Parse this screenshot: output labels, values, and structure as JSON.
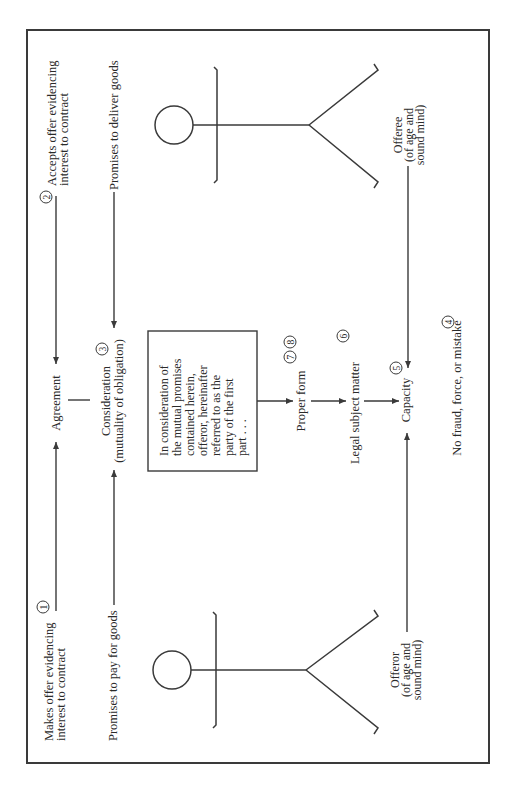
{
  "diagram": {
    "orientation": "rotated-90-ccw",
    "colors": {
      "ink": "#2a2a2a",
      "line": "#3a3a3a",
      "background": "#ffffff"
    },
    "offeror_side": {
      "step_number": "1",
      "offer_line1": "Makes offer evidencing",
      "offer_line2": "interest to contract",
      "promise": "Promises to pay for goods",
      "label_line1": "Offeror",
      "label_line2": "(of age and",
      "label_line3": "sound mind)"
    },
    "offeree_side": {
      "step_number": "2",
      "accept_line1": "Accepts offer evidencing",
      "accept_line2": "interest to contract",
      "promise": "Promises to deliver goods",
      "label_line1": "Offeree",
      "label_line2": "(of age and",
      "label_line3": "sound mind)"
    },
    "center": {
      "agreement": "Agreement",
      "consideration_line1": "Consideration",
      "consideration_line2": "(mutuality of obligation)",
      "consideration_number": "3",
      "contract_box_lines": [
        "In consideration of",
        "the mutual promises",
        "contained herein,",
        "offeror, hereinafter",
        "referred to as the",
        "party of the first",
        "part . . ."
      ],
      "proper_form": "Proper form",
      "proper_form_numbers": [
        "7",
        "8"
      ],
      "legal_subject_matter": "Legal subject matter",
      "legal_subject_number": "6",
      "capacity": "Capacity",
      "capacity_number": "5",
      "no_fraud": "No fraud, force, or mistake",
      "no_fraud_number": "4"
    }
  }
}
